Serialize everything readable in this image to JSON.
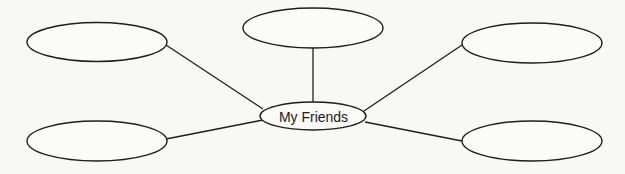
{
  "diagram": {
    "type": "mind-map",
    "center": {
      "label": "My Friends",
      "cx": 313,
      "cy": 116,
      "rx": 53,
      "ry": 14
    },
    "nodes": [
      {
        "id": "top-left",
        "label": "",
        "cx": 97,
        "cy": 42,
        "rx": 70,
        "ry": 19.5
      },
      {
        "id": "top-center",
        "label": "",
        "cx": 313,
        "cy": 28,
        "rx": 70,
        "ry": 20
      },
      {
        "id": "top-right",
        "label": "",
        "cx": 532,
        "cy": 43,
        "rx": 70,
        "ry": 20
      },
      {
        "id": "bottom-left",
        "label": "",
        "cx": 97,
        "cy": 141,
        "rx": 70,
        "ry": 20
      },
      {
        "id": "bottom-right",
        "label": "",
        "cx": 532,
        "cy": 141,
        "rx": 70,
        "ry": 20
      }
    ],
    "edges": [
      {
        "from": "top-left",
        "x1": 166,
        "y1": 45,
        "x2": 263,
        "y2": 109
      },
      {
        "from": "top-center",
        "x1": 313,
        "y1": 48,
        "x2": 313,
        "y2": 102
      },
      {
        "from": "top-right",
        "x1": 462,
        "y1": 45,
        "x2": 364,
        "y2": 111
      },
      {
        "from": "bottom-left",
        "x1": 166,
        "y1": 139,
        "x2": 263,
        "y2": 120
      },
      {
        "from": "bottom-right",
        "x1": 462,
        "y1": 141,
        "x2": 365,
        "y2": 122
      }
    ],
    "colors": {
      "background": "#f8f8f6",
      "stroke": "#1e1e1e",
      "text": "#1a1a1a"
    }
  }
}
